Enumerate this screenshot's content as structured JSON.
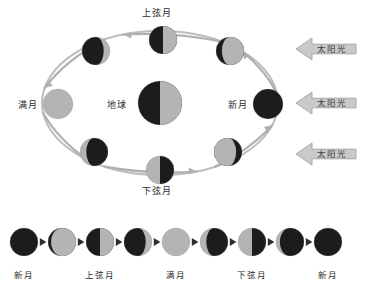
{
  "diagram": {
    "title_text": "",
    "colors": {
      "dark": "#1c1c1c",
      "light": "#b4b4b4",
      "orbit": "#bdbdbd",
      "arrow": "#b0b0b0",
      "sun_arrow_fill": "#c9c9c9",
      "sun_arrow_stroke": "#9a9a9a",
      "text": "#2b2b2b",
      "background": "#ffffff"
    },
    "center": {
      "name": "earth",
      "label": "地球",
      "label_x": 107,
      "label_y": 101,
      "cx": 160,
      "cy": 103,
      "r": 22,
      "phase": "half-right-lit"
    },
    "orbit": {
      "cx": 160,
      "cy": 103,
      "rx": 118,
      "ry": 72,
      "direction": "counterclockwise"
    },
    "orbit_moons": [
      {
        "name": "first-quarter",
        "label": "上弦月",
        "label_x": 142,
        "label_y": 9,
        "cx": 163,
        "cy": 40,
        "r": 14,
        "phase": "half-right-lit",
        "labelled": true
      },
      {
        "name": "waxing-gibbous",
        "label": "",
        "cx": 96,
        "cy": 51,
        "r": 14,
        "phase": "gibbous-right-lit",
        "labelled": false
      },
      {
        "name": "full-moon",
        "label": "满月",
        "label_x": 18,
        "label_y": 101,
        "cx": 58,
        "cy": 104,
        "r": 15,
        "phase": "full-lit",
        "labelled": true
      },
      {
        "name": "waning-gibbous",
        "label": "",
        "cx": 94,
        "cy": 152,
        "r": 14,
        "phase": "gibbous-left-lit",
        "labelled": false
      },
      {
        "name": "last-quarter",
        "label": "下弦月",
        "label_x": 142,
        "label_y": 187,
        "cx": 160,
        "cy": 170,
        "r": 14,
        "phase": "half-left-lit",
        "labelled": true
      },
      {
        "name": "waning-crescent",
        "label": "",
        "cx": 228,
        "cy": 152,
        "r": 14,
        "phase": "crescent-left-lit",
        "labelled": false
      },
      {
        "name": "new-moon",
        "label": "新月",
        "label_x": 228,
        "label_y": 101,
        "cx": 268,
        "cy": 104,
        "r": 15,
        "phase": "new-dark",
        "labelled": true
      },
      {
        "name": "waxing-crescent",
        "label": "",
        "cx": 230,
        "cy": 51,
        "r": 14,
        "phase": "crescent-right-lit",
        "labelled": false
      }
    ],
    "sun_arrows": [
      {
        "name": "sunlight-arrow-top",
        "label": "太阳光",
        "x": 296,
        "y": 38
      },
      {
        "name": "sunlight-arrow-middle",
        "label": "太阳光",
        "x": 296,
        "y": 92
      },
      {
        "name": "sunlight-arrow-bottom",
        "label": "太阳光",
        "x": 296,
        "y": 143
      }
    ],
    "phase_strip": {
      "moons": [
        {
          "name": "strip-new-moon-1",
          "cx": 24,
          "cy": 242,
          "r": 14,
          "phase": "new-dark"
        },
        {
          "name": "strip-waxing-crescent-thin",
          "cx": 62,
          "cy": 242,
          "r": 14,
          "phase": "crescent-right-lit-thin"
        },
        {
          "name": "strip-first-quarter",
          "cx": 100,
          "cy": 242,
          "r": 14,
          "phase": "half-right-lit"
        },
        {
          "name": "strip-waxing-gibbous",
          "cx": 138,
          "cy": 242,
          "r": 14,
          "phase": "gibbous-right-lit"
        },
        {
          "name": "strip-full-moon",
          "cx": 176,
          "cy": 242,
          "r": 14,
          "phase": "full-lit"
        },
        {
          "name": "strip-waning-gibbous",
          "cx": 214,
          "cy": 242,
          "r": 14,
          "phase": "gibbous-left-lit"
        },
        {
          "name": "strip-last-quarter",
          "cx": 252,
          "cy": 242,
          "r": 14,
          "phase": "half-left-lit"
        },
        {
          "name": "strip-waning-crescent",
          "cx": 290,
          "cy": 242,
          "r": 14,
          "phase": "crescent-left-lit-thin"
        },
        {
          "name": "strip-new-moon-2",
          "cx": 328,
          "cy": 242,
          "r": 14,
          "phase": "new-dark"
        }
      ],
      "labels": [
        {
          "name": "strip-label-new-moon-start",
          "text": "新月",
          "x": 24,
          "y": 271
        },
        {
          "name": "strip-label-first-quarter",
          "text": "上弦月",
          "x": 100,
          "y": 271
        },
        {
          "name": "strip-label-full-moon",
          "text": "满月",
          "x": 176,
          "y": 271
        },
        {
          "name": "strip-label-last-quarter",
          "text": "下弦月",
          "x": 252,
          "y": 271
        },
        {
          "name": "strip-label-new-moon-end",
          "text": "新月",
          "x": 328,
          "y": 271
        }
      ],
      "separator_count": 8
    }
  }
}
